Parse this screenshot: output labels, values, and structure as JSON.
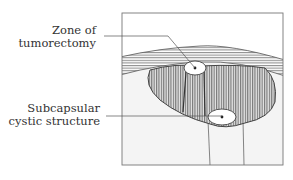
{
  "diagram": {
    "labels": [
      {
        "line1": "Zone of",
        "line2": "tumorectomy"
      },
      {
        "line1": "Subcapsular",
        "line2": "cystic structure"
      }
    ],
    "colors": {
      "line": "#555555",
      "frame": "#666666",
      "background": "#f2f2f2",
      "hatch": "#777777",
      "ellipse_fill": "#ffffff"
    }
  }
}
